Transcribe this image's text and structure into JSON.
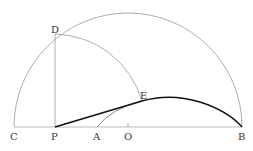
{
  "diagram": {
    "labels": {
      "C": "C",
      "P": "P",
      "A": "A",
      "O": "O",
      "B": "B",
      "D": "D",
      "E": "E"
    },
    "colors": {
      "thin_line": "#999999",
      "thick_line": "#111111",
      "label": "#333333",
      "background": "#ffffff"
    }
  }
}
